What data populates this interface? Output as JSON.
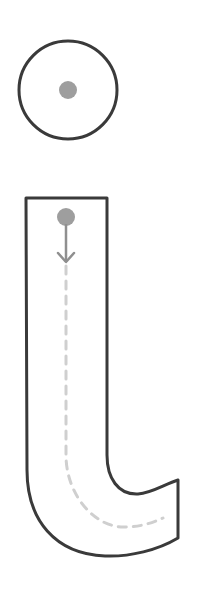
{
  "worksheet": {
    "letter": "i",
    "title": "Letter i tracing guide"
  },
  "colors": {
    "outline": "#3a3a3a",
    "start_dot": "#9e9e9e",
    "arrow": "#8f8f8f",
    "trace_path": "#cfcfcf",
    "fill": "#ffffff"
  },
  "dot_circle": {
    "cx": 68,
    "cy": 90,
    "r": 49,
    "dot_r": 9
  },
  "stem": {
    "start_dot": {
      "cx": 66,
      "cy": 217,
      "r": 9
    },
    "arrow": {
      "x": 66,
      "y1": 226,
      "y2": 262
    }
  }
}
